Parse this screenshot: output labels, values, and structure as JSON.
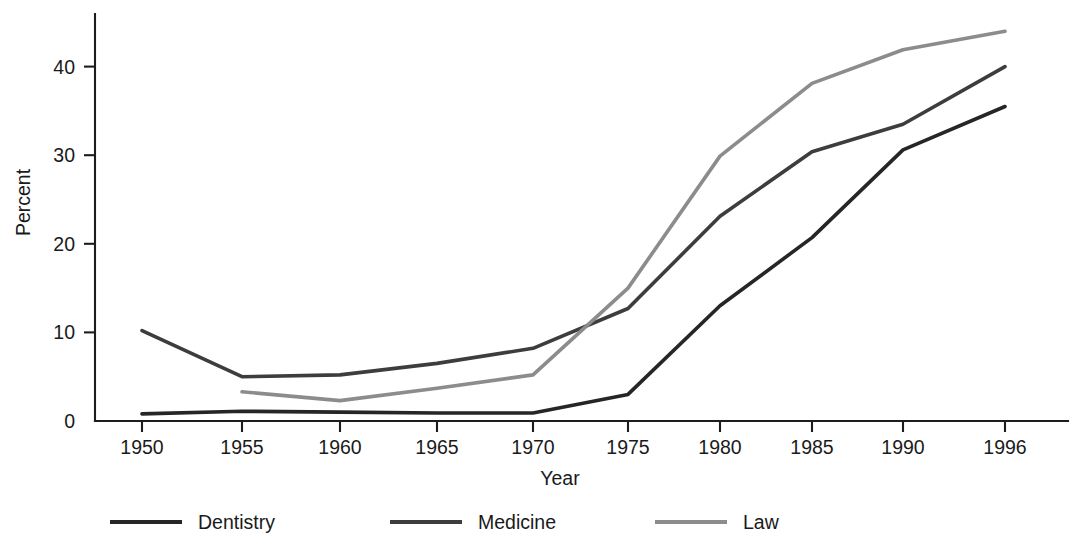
{
  "chart_data": {
    "type": "line",
    "title": "",
    "xlabel": "Year",
    "ylabel": "Percent",
    "x": [
      1950,
      1955,
      1960,
      1965,
      1970,
      1975,
      1980,
      1985,
      1990,
      1996
    ],
    "categories": [
      "1950",
      "1955",
      "1960",
      "1965",
      "1970",
      "1975",
      "1980",
      "1985",
      "1990",
      "1996"
    ],
    "xtick_labels": [
      "1950",
      "1955",
      "1960",
      "1965",
      "1970",
      "1975",
      "1980",
      "1985",
      "1990",
      "1996"
    ],
    "ytick_labels": [
      "0",
      "10",
      "20",
      "30",
      "40"
    ],
    "ytick_values": [
      0,
      10,
      20,
      30,
      40
    ],
    "xlim": [
      1950,
      1996
    ],
    "ylim": [
      0,
      45
    ],
    "grid": false,
    "legend_position": "bottom",
    "series": [
      {
        "name": "Dentistry",
        "color": "#262626",
        "x": [
          1950,
          1955,
          1960,
          1965,
          1970,
          1975,
          1980,
          1985,
          1990,
          1996
        ],
        "values": [
          0.8,
          1.1,
          1.0,
          0.9,
          0.9,
          3.0,
          13.0,
          20.7,
          30.6,
          35.5
        ]
      },
      {
        "name": "Medicine",
        "color": "#3d3d3d",
        "x": [
          1950,
          1955,
          1960,
          1965,
          1970,
          1975,
          1980,
          1985,
          1990,
          1996
        ],
        "values": [
          10.2,
          5.0,
          5.2,
          6.5,
          8.2,
          12.7,
          23.1,
          30.4,
          33.5,
          40.0
        ]
      },
      {
        "name": "Law",
        "color": "#8c8c8c",
        "x": [
          1955,
          1960,
          1965,
          1970,
          1975,
          1980,
          1985,
          1990,
          1996
        ],
        "values": [
          3.3,
          2.3,
          3.7,
          5.2,
          15.0,
          29.9,
          38.1,
          41.9,
          44.0
        ]
      }
    ]
  },
  "legend": {
    "items": [
      {
        "label": "Dentistry",
        "color": "#262626"
      },
      {
        "label": "Medicine",
        "color": "#3d3d3d"
      },
      {
        "label": "Law",
        "color": "#8c8c8c"
      }
    ]
  },
  "axes": {
    "y_title": "Percent",
    "x_title": "Year"
  }
}
